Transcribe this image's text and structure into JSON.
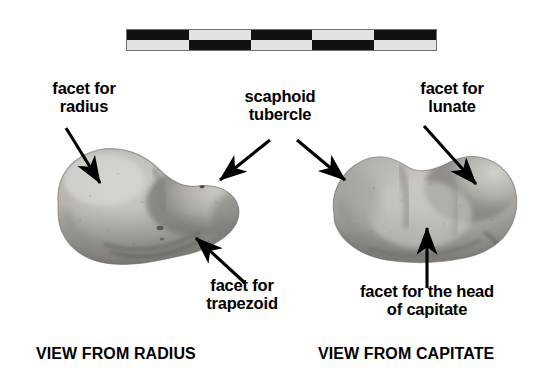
{
  "figure": {
    "background_color": "#ffffff",
    "text_color": "#000000"
  },
  "scale_bar": {
    "name": "photographic scale bar",
    "pattern": "checkerboard",
    "cells_per_row": 5,
    "rows": 2,
    "dark_color": "#111111",
    "light_color": "#e2e2e2",
    "border_color": "#6f6f6f",
    "top_row": [
      "dark",
      "light",
      "dark",
      "light",
      "dark"
    ],
    "bottom_row": [
      "light",
      "dark",
      "light",
      "dark",
      "light"
    ]
  },
  "specimens": [
    {
      "id": "left",
      "name": "scaphoid bone viewed from radius",
      "caption": "VIEW FROM RADIUS",
      "shape": "kidney-shaped bean with concave lower-right margin"
    },
    {
      "id": "right",
      "name": "scaphoid bone viewed from capitate",
      "caption": "VIEW FROM CAPITATE",
      "shape": "broad oval with rounded lobes"
    }
  ],
  "labels": {
    "facet_for_radius": "facet for\nradius",
    "scaphoid_tubercle": "scaphoid\ntubercle",
    "facet_for_lunate": "facet for\nlunate",
    "facet_for_trapezoid": "facet for\ntrapezoid",
    "facet_for_head_of_capitate": "facet for the head\nof capitate"
  },
  "captions": {
    "left": "VIEW FROM RADIUS",
    "right": "VIEW FROM CAPITATE"
  },
  "arrows": [
    {
      "name": "arrow-facet-for-radius",
      "from_label": "facet for radius",
      "direction": "down-right",
      "points_to": "upper left surface of left specimen"
    },
    {
      "name": "arrow-scaphoid-tubercle-left",
      "from_label": "scaphoid tubercle",
      "direction": "down-left",
      "points_to": "right end of left specimen"
    },
    {
      "name": "arrow-scaphoid-tubercle-right",
      "from_label": "scaphoid tubercle",
      "direction": "down-right",
      "points_to": "left end of right specimen"
    },
    {
      "name": "arrow-facet-for-lunate",
      "from_label": "facet for lunate",
      "direction": "down-right",
      "points_to": "upper right surface of right specimen"
    },
    {
      "name": "arrow-facet-for-trapezoid",
      "from_label": "facet for trapezoid",
      "direction": "up-left",
      "points_to": "lower right margin of left specimen"
    },
    {
      "name": "arrow-facet-for-head-of-capitate",
      "from_label": "facet for the head of capitate",
      "direction": "up",
      "points_to": "lower middle surface of right specimen"
    }
  ]
}
